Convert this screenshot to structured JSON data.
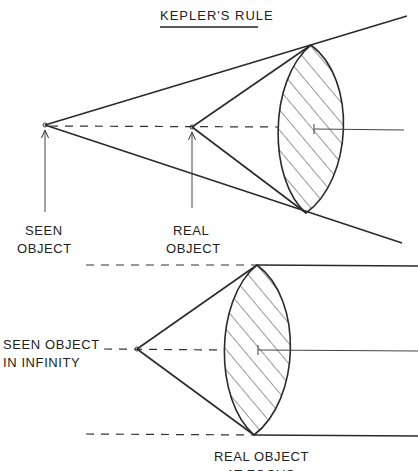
{
  "title": "KEPLER'S RULE",
  "upper_diagram": {
    "labels": {
      "seen_object": [
        "SEEN",
        "OBJECT"
      ],
      "real_object": [
        "REAL",
        "OBJECT"
      ]
    }
  },
  "lower_diagram": {
    "labels": {
      "seen_object_infinity": [
        "SEEN OBJECT",
        "IN INFINITY"
      ],
      "real_object_focus": [
        "REAL OBJECT",
        "AT FOCUS"
      ]
    }
  },
  "colors": {
    "ink": "#2a2a2a",
    "background": "#ffffff"
  }
}
